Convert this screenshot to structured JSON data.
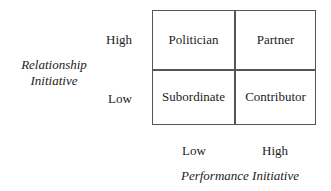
{
  "y_axis": {
    "title_line1": "Relationship",
    "title_line2": "Initiative",
    "ticks": [
      "High",
      "Low"
    ]
  },
  "x_axis": {
    "title": "Performance Initiative",
    "ticks": [
      "Low",
      "High"
    ]
  },
  "quadrants": {
    "top_left": "Politician",
    "top_right": "Partner",
    "bottom_left": "Subordinate",
    "bottom_right": "Contributor"
  }
}
